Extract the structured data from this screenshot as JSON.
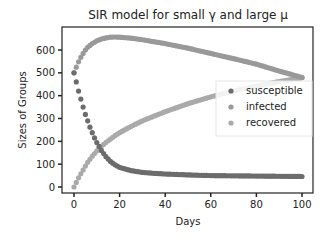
{
  "chart_data": {
    "type": "scatter",
    "title": "SIR model for small γ and large μ",
    "xlabel": "Days",
    "ylabel": "Sizes of Groups",
    "xlim": [
      -4,
      104
    ],
    "ylim": [
      -25,
      690
    ],
    "xticks": [
      0,
      20,
      40,
      60,
      80,
      100
    ],
    "yticks": [
      0,
      100,
      200,
      300,
      400,
      500,
      600
    ],
    "legend_position": "center-right",
    "grid": false,
    "series": [
      {
        "name": "susceptible",
        "color": "#6c6c6c",
        "x": [
          0,
          1,
          2,
          3,
          4,
          5,
          6,
          7,
          8,
          9,
          10,
          12,
          14,
          16,
          18,
          20,
          25,
          30,
          35,
          40,
          50,
          60,
          70,
          80,
          90,
          100
        ],
        "y": [
          500,
          460,
          420,
          385,
          350,
          318,
          290,
          262,
          238,
          215,
          195,
          160,
          133,
          112,
          97,
          86,
          72,
          64,
          60,
          57,
          53,
          50,
          49,
          48,
          47,
          46
        ]
      },
      {
        "name": "infected",
        "color": "#999999",
        "x": [
          0,
          1,
          2,
          3,
          4,
          5,
          6,
          8,
          10,
          12,
          14,
          16,
          18,
          20,
          25,
          30,
          40,
          50,
          60,
          70,
          80,
          90,
          100
        ],
        "y": [
          500,
          525,
          548,
          568,
          585,
          600,
          612,
          628,
          640,
          648,
          653,
          656,
          657,
          656,
          652,
          645,
          628,
          608,
          585,
          562,
          538,
          508,
          480
        ]
      },
      {
        "name": "recovered",
        "color": "#aaaaaa",
        "x": [
          0,
          1,
          2,
          3,
          4,
          5,
          6,
          8,
          10,
          12,
          14,
          16,
          18,
          20,
          25,
          30,
          40,
          50,
          60,
          70,
          80,
          90,
          100
        ],
        "y": [
          0,
          20,
          40,
          58,
          75,
          92,
          108,
          135,
          158,
          178,
          195,
          210,
          225,
          238,
          265,
          290,
          330,
          365,
          395,
          420,
          442,
          462,
          478
        ]
      }
    ]
  }
}
